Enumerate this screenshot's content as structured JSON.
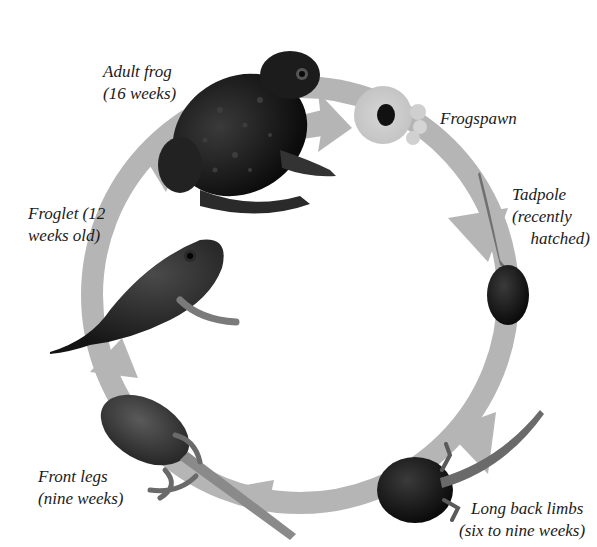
{
  "diagram": {
    "ring_color": "#b5b5b5",
    "stages": [
      {
        "id": "adult-frog",
        "line1": "Adult frog",
        "line2": "(16 weeks)"
      },
      {
        "id": "frogspawn",
        "line1": "Frogspawn",
        "line2": ""
      },
      {
        "id": "tadpole",
        "line1": "Tadpole",
        "line2": "(recently",
        "line3": "hatched)"
      },
      {
        "id": "long-back-limbs",
        "line1": "Long back limbs",
        "line2": "(six to nine weeks)"
      },
      {
        "id": "front-legs",
        "line1": "Front legs",
        "line2": "(nine weeks)"
      },
      {
        "id": "froglet",
        "line1": "Froglet (12",
        "line2": "weeks old)"
      }
    ]
  }
}
